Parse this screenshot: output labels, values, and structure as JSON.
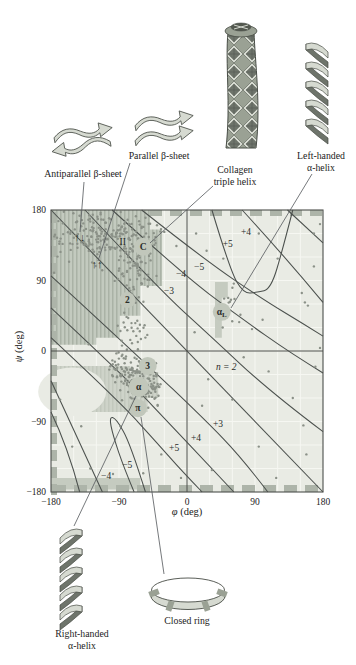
{
  "captions": {
    "antiparallel": "Antiparallel β-sheet",
    "parallel": "Parallel β-sheet",
    "collagen_1": "Collagen",
    "collagen_2": "triple helix",
    "left_helix_1": "Left-handed",
    "left_helix_2": "α-helix",
    "right_helix_1": "Right-handed",
    "right_helix_2": "α-helix",
    "closed_ring": "Closed ring"
  },
  "axes": {
    "x": {
      "greek": "φ",
      "unit": " (deg)",
      "ticks": [
        {
          "v": -180,
          "t": "−180"
        },
        {
          "v": -90,
          "t": "−90"
        },
        {
          "v": 0,
          "t": "0"
        },
        {
          "v": 90,
          "t": "90"
        },
        {
          "v": 180,
          "t": "180"
        }
      ]
    },
    "y": {
      "greek": "ψ",
      "unit": " (deg)",
      "ticks": [
        {
          "v": 180,
          "t": "180"
        },
        {
          "v": 90,
          "t": "90"
        },
        {
          "v": 0,
          "t": "0"
        },
        {
          "v": -90,
          "t": "−90"
        },
        {
          "v": -180,
          "t": "−180"
        }
      ]
    }
  },
  "chart_data": {
    "type": "scatter",
    "xlabel": "φ (deg)",
    "ylabel": "ψ (deg)",
    "xlim": [
      -180,
      180
    ],
    "ylim": [
      -180,
      180
    ],
    "grid_step_deg": 30,
    "colors": {
      "plot_bg": "#e9ebe4",
      "grid": "#f6f7f2",
      "dot": "#8b9188",
      "contour": "#4b504d",
      "frame": "#4c4f4b",
      "leader": "#53575a",
      "region_beta": "#c3cabf",
      "region_beta_stripe": "#aab2a6",
      "region_alpha": "#ced3c9",
      "region_alpha_stripe": "#c2c8bd",
      "region_patch": "#c5cbc0",
      "edge_dash": "#adb4a9",
      "symbol_circle": "#c1c7bb",
      "text": "#2a2d2a",
      "illus_light": "#d6dad1",
      "illus_mid": "#9aa194",
      "illus_dark": "#6e746b"
    },
    "contour_labels": [
      {
        "text": "+4",
        "phi": 78,
        "psi": 152
      },
      {
        "text": "+5",
        "phi": 54,
        "psi": 136
      },
      {
        "text": "−5",
        "phi": 16,
        "psi": 107
      },
      {
        "text": "−4",
        "phi": -8,
        "psi": 98
      },
      {
        "text": "−3",
        "phi": -24,
        "psi": 77
      },
      {
        "text": "+3",
        "phi": 41,
        "psi": -93
      },
      {
        "text": "+4",
        "phi": 12,
        "psi": -111
      },
      {
        "text": "+5",
        "phi": -17,
        "psi": -124
      },
      {
        "text": "−5",
        "phi": -79,
        "psi": -145
      },
      {
        "text": "−4",
        "phi": -107,
        "psi": -159
      }
    ],
    "contours": [
      {
        "name": "n2",
        "pts": [
          [
            -180,
            180
          ],
          [
            180,
            -180
          ]
        ]
      },
      {
        "name": "minus3-upper",
        "pts": [
          [
            -135,
            180
          ],
          [
            -36,
            78
          ],
          [
            30,
            20
          ],
          [
            110,
            -52
          ],
          [
            180,
            -103
          ]
        ]
      },
      {
        "name": "minus4-upper",
        "pts": [
          [
            -99,
            180
          ],
          [
            -9,
            101
          ],
          [
            67,
            45
          ],
          [
            139,
            -4
          ],
          [
            180,
            -28
          ]
        ]
      },
      {
        "name": "minus5-upper",
        "pts": [
          [
            -60,
            180
          ],
          [
            24,
            116
          ],
          [
            102,
            65
          ],
          [
            152,
            36
          ],
          [
            180,
            19
          ]
        ]
      },
      {
        "name": "loop-upper",
        "pts": [
          [
            33,
            180
          ],
          [
            57,
            103
          ],
          [
            75,
            73
          ],
          [
            93,
            75
          ],
          [
            111,
            79
          ],
          [
            127,
            131
          ],
          [
            140,
            180
          ]
        ]
      },
      {
        "name": "plus4-right",
        "pts": [
          [
            73,
            180
          ],
          [
            132,
            118
          ],
          [
            180,
            62
          ]
        ]
      },
      {
        "name": "corner-right",
        "pts": [
          [
            133,
            180
          ],
          [
            180,
            138
          ]
        ]
      },
      {
        "name": "plus3-lower",
        "pts": [
          [
            -180,
            96
          ],
          [
            -62,
            -9
          ],
          [
            24,
            -88
          ],
          [
            73,
            -137
          ],
          [
            107,
            -180
          ]
        ]
      },
      {
        "name": "plus4-lower",
        "pts": [
          [
            -180,
            55
          ],
          [
            -78,
            -37
          ],
          [
            -15,
            -101
          ],
          [
            26,
            -143
          ],
          [
            62,
            -180
          ]
        ]
      },
      {
        "name": "plus5-lower",
        "pts": [
          [
            -180,
            17
          ],
          [
            -91,
            -63
          ],
          [
            -38,
            -119
          ],
          [
            -8,
            -152
          ],
          [
            20,
            -180
          ]
        ]
      },
      {
        "name": "loop-lower",
        "pts": [
          [
            -55,
            -180
          ],
          [
            -75,
            -118
          ],
          [
            -94,
            -86
          ],
          [
            -103,
            -84
          ],
          [
            -98,
            -108
          ],
          [
            -83,
            -150
          ],
          [
            -70,
            -180
          ]
        ]
      },
      {
        "name": "minus5-lower",
        "pts": [
          [
            -180,
            -38
          ],
          [
            -168,
            -63
          ],
          [
            -112,
            -180
          ]
        ]
      },
      {
        "name": "minus4-lower",
        "pts": [
          [
            -180,
            -78
          ],
          [
            -158,
            -122
          ],
          [
            -142,
            -180
          ]
        ]
      }
    ],
    "symbols": [
      {
        "text": "↑↓",
        "phi": -142,
        "psi": 144,
        "kind": "arrows"
      },
      {
        "text": "↑↑",
        "phi": -119,
        "psi": 110,
        "kind": "arrows"
      },
      {
        "text": "II",
        "phi": -85,
        "psi": 139,
        "kind": "plain"
      },
      {
        "text": "C",
        "phi": -58,
        "psi": 133,
        "kind": "circle",
        "r": 9
      },
      {
        "text": "2",
        "phi": -79,
        "psi": 65,
        "kind": "circle",
        "r": 8
      },
      {
        "text": "3",
        "phi": -52,
        "psi": -19,
        "kind": "circle",
        "r": 9
      },
      {
        "text": "α",
        "phi": -64,
        "psi": -46,
        "kind": "circle",
        "r": 10
      },
      {
        "text": "π",
        "phi": -65,
        "psi": -73,
        "kind": "circle",
        "r": 9
      },
      {
        "text": "α",
        "sub": "L",
        "phi": 46,
        "psi": 50,
        "kind": "circle",
        "r": 9
      },
      {
        "text": "n = 2",
        "phi": 52,
        "psi": -20,
        "kind": "italic"
      }
    ],
    "regions": {
      "beta_hatched": [
        [
          -180,
          180
        ],
        [
          -49,
          180
        ],
        [
          -49,
          155
        ],
        [
          -33,
          155
        ],
        [
          -33,
          83
        ],
        [
          -62,
          83
        ],
        [
          -62,
          45
        ],
        [
          -89,
          45
        ],
        [
          -89,
          17
        ],
        [
          -120,
          17
        ],
        [
          -120,
          8
        ],
        [
          -180,
          8
        ]
      ],
      "alpha": [
        [
          -180,
          -19
        ],
        [
          -75,
          -19
        ],
        [
          -75,
          -27
        ],
        [
          -38,
          -27
        ],
        [
          -38,
          -60
        ],
        [
          -52,
          -60
        ],
        [
          -52,
          -78
        ],
        [
          -180,
          -78
        ]
      ],
      "alpha_white_cut": {
        "phi": -152,
        "psi": -52,
        "rphi": 45,
        "rpsi": 31
      },
      "corner": [
        [
          -180,
          -162
        ],
        [
          -62,
          -162
        ],
        [
          -62,
          -177
        ],
        [
          -180,
          -177
        ]
      ],
      "alphaL_patch": [
        [
          37,
          88
        ],
        [
          54,
          88
        ],
        [
          54,
          68
        ],
        [
          46,
          68
        ],
        [
          46,
          17
        ],
        [
          37,
          17
        ]
      ]
    },
    "clusters": [
      {
        "name": "beta-main",
        "n": 200,
        "cx": -108,
        "cy": 148,
        "sx": 36,
        "sy": 18,
        "tilt": 0,
        "clip": [
          -178,
          -33,
          80,
          178
        ]
      },
      {
        "name": "beta-lower",
        "n": 90,
        "cx": -70,
        "cy": 120,
        "sx": 16,
        "sy": 24,
        "tilt": 0,
        "clip": [
          -170,
          -28,
          58,
          178
        ]
      },
      {
        "name": "bridge",
        "n": 45,
        "cx": -74,
        "cy": 30,
        "sx": 11,
        "sy": 34,
        "tilt": 0,
        "clip": [
          -130,
          -40,
          -30,
          95
        ]
      },
      {
        "name": "alpha",
        "n": 200,
        "cx": -66,
        "cy": -34,
        "sx": 22,
        "sy": 14,
        "tilt": -0.45,
        "clip": [
          -165,
          -35,
          -75,
          10
        ]
      },
      {
        "name": "alpha-L",
        "n": 11,
        "cx": 57,
        "cy": 44,
        "sx": 9,
        "sy": 13,
        "tilt": 0,
        "clip": [
          35,
          80,
          10,
          85
        ]
      }
    ],
    "sparse_points": [
      [
        95,
        150
      ],
      [
        120,
        118
      ],
      [
        152,
        74
      ],
      [
        160,
        58
      ],
      [
        176,
        162
      ],
      [
        168,
        150
      ],
      [
        62,
        86
      ],
      [
        75,
        -8
      ],
      [
        108,
        -26
      ],
      [
        140,
        -60
      ],
      [
        154,
        -95
      ],
      [
        60,
        -62
      ],
      [
        20,
        -70
      ],
      [
        95,
        -122
      ],
      [
        33,
        -152
      ],
      [
        -8,
        -162
      ],
      [
        -58,
        -156
      ],
      [
        -98,
        -157
      ],
      [
        -128,
        -150
      ],
      [
        -152,
        -122
      ],
      [
        -140,
        -96
      ],
      [
        -168,
        -62
      ],
      [
        -88,
        -96
      ],
      [
        -34,
        -132
      ],
      [
        10,
        24
      ],
      [
        28,
        -36
      ],
      [
        158,
        -132
      ],
      [
        118,
        -162
      ],
      [
        -176,
        100
      ],
      [
        100,
        40
      ],
      [
        86,
        28
      ],
      [
        -30,
        152
      ],
      [
        -14,
        134
      ],
      [
        12,
        150
      ],
      [
        26,
        128
      ],
      [
        48,
        118
      ],
      [
        168,
        108
      ],
      [
        156,
        62
      ],
      [
        170,
        -20
      ],
      [
        176,
        4
      ]
    ]
  }
}
